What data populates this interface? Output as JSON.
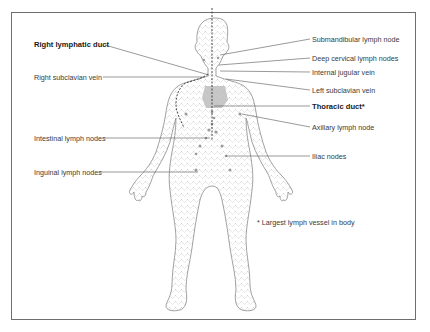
{
  "diagram": {
    "labels_left": [
      {
        "id": "right-lymphatic-duct",
        "text": "Right lymphatic duct",
        "bold": true,
        "x": 34,
        "y": 40
      },
      {
        "id": "right-subclavian-vein",
        "text": "Right subclavian vein",
        "bold": false,
        "x": 34,
        "y": 72
      },
      {
        "id": "intestinal-lymph-nodes",
        "text": "Intestinal lymph nodes",
        "bold": false,
        "x": 34,
        "y": 133
      },
      {
        "id": "inguinal-lymph-nodes",
        "text": "Inguinal lymph nodes",
        "bold": false,
        "x": 34,
        "y": 167
      }
    ],
    "labels_right": [
      {
        "id": "submandibular-lymph-node",
        "text": "Submandibular lymph node",
        "bold": false,
        "x": 312,
        "y": 35
      },
      {
        "id": "deep-cervical-lymph-nodes",
        "text": "Deep cervical lymph nodes",
        "bold": false,
        "x": 312,
        "y": 54
      },
      {
        "id": "internal-jugular-vein",
        "text": "Internal jugular vein",
        "bold": false,
        "x": 312,
        "y": 68
      },
      {
        "id": "left-subclavian-vein",
        "text": "Left subclavian vein",
        "bold": false,
        "x": 312,
        "y": 86
      },
      {
        "id": "thoracic-duct",
        "text": "Thoracic duct*",
        "bold": true,
        "x": 312,
        "y": 102
      },
      {
        "id": "axillary-lymph-node",
        "text": "Axillary lymph node",
        "bold": false,
        "x": 312,
        "y": 123
      },
      {
        "id": "iliac-nodes",
        "text": "Iliac nodes",
        "bold": false,
        "x": 312,
        "y": 152
      }
    ],
    "footnote": "* Largest lymph vessel in body",
    "colors": {
      "frame": "#6e6e6e",
      "leader": "#555555",
      "body_outline": "#7a7a7a",
      "vessels": "#a8a8a8",
      "heart_area": "#bdbdbd",
      "duct_dashed": "#333333"
    }
  }
}
